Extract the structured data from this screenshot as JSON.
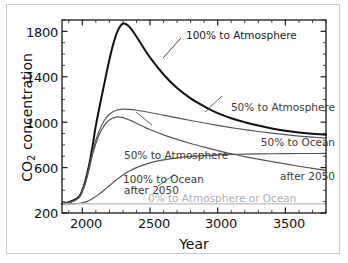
{
  "chart_data": {
    "type": "line",
    "title": "",
    "xlabel": "Year",
    "ylabel": "CO2 concentration",
    "ylabel_rich": "CO₂ concentration",
    "xlim": [
      1850,
      3800
    ],
    "ylim": [
      200,
      1900
    ],
    "xticks": [
      2000,
      2500,
      3000,
      3500
    ],
    "xtick_labels": [
      "2000",
      "2500",
      "3000",
      "3500"
    ],
    "yticks": [
      200,
      600,
      1000,
      1400,
      1800
    ],
    "ytick_labels": [
      "200",
      "600",
      "1000",
      "1400",
      "1800"
    ],
    "x_minor_tick_step": 100,
    "y_minor_tick_step": 100,
    "grid": false,
    "legend": "inline annotations",
    "series": [
      {
        "name": "100% to Atmosphere",
        "color": "#111111",
        "width": 2.0,
        "x": [
          1850,
          1900,
          1950,
          1980,
          2000,
          2020,
          2050,
          2080,
          2100,
          2140,
          2180,
          2220,
          2260,
          2300,
          2340,
          2380,
          2440,
          2500,
          2600,
          2700,
          2800,
          2900,
          3000,
          3100,
          3200,
          3300,
          3400,
          3500,
          3600,
          3700,
          3800
        ],
        "y": [
          280,
          295,
          320,
          350,
          400,
          470,
          620,
          820,
          970,
          1210,
          1440,
          1650,
          1800,
          1868,
          1850,
          1790,
          1680,
          1570,
          1420,
          1300,
          1210,
          1140,
          1080,
          1035,
          1000,
          970,
          945,
          925,
          910,
          898,
          890
        ]
      },
      {
        "name": "50% to Atmosphere 50% to Ocean after 2050",
        "color": "#555555",
        "width": 1.2,
        "x": [
          1850,
          1900,
          1950,
          1980,
          2000,
          2020,
          2050,
          2080,
          2120,
          2160,
          2200,
          2250,
          2300,
          2350,
          2400,
          2500,
          2600,
          2700,
          2800,
          2900,
          3000,
          3100,
          3200,
          3300,
          3400,
          3500,
          3600,
          3700,
          3800
        ],
        "y": [
          280,
          292,
          315,
          345,
          395,
          460,
          600,
          760,
          910,
          1010,
          1070,
          1105,
          1115,
          1112,
          1105,
          1085,
          1062,
          1038,
          1015,
          993,
          972,
          952,
          934,
          918,
          903,
          890,
          878,
          868,
          860
        ]
      },
      {
        "name": "50% to Atmosphere after 2050",
        "color": "#555555",
        "width": 1.2,
        "x": [
          1850,
          1900,
          1950,
          1980,
          2000,
          2020,
          2050,
          2080,
          2120,
          2160,
          2200,
          2250,
          2300,
          2350,
          2400,
          2450,
          2500,
          2600,
          2700,
          2800,
          2900,
          3000,
          3100,
          3200,
          3300,
          3400,
          3500,
          3600,
          3700,
          3800
        ],
        "y": [
          280,
          291,
          313,
          342,
          390,
          452,
          585,
          735,
          878,
          968,
          1020,
          1045,
          1040,
          1018,
          990,
          962,
          935,
          888,
          848,
          812,
          780,
          750,
          722,
          697,
          674,
          652,
          632,
          612,
          593,
          575
        ]
      },
      {
        "name": "100% to Ocean",
        "color": "#555555",
        "width": 1.2,
        "x": [
          1850,
          1900,
          1950,
          1980,
          2000,
          2020,
          2050,
          2080,
          2120,
          2160,
          2200,
          2250,
          2300,
          2350,
          2400,
          2500,
          2600,
          2700,
          2800,
          2900,
          3000,
          3100,
          3200,
          3300,
          3400,
          3500,
          3600,
          3700,
          3800
        ],
        "y": [
          280,
          281,
          283,
          286,
          290,
          296,
          310,
          330,
          362,
          400,
          440,
          490,
          535,
          572,
          600,
          642,
          668,
          686,
          698,
          706,
          712,
          716,
          719,
          721,
          722,
          723,
          724,
          724,
          725
        ]
      },
      {
        "name": "0% to Atmosphere or Ocean",
        "color": "#bdbdbd",
        "width": 1.2,
        "x": [
          1850,
          2000,
          2200,
          2500,
          3000,
          3400,
          3800
        ],
        "y": [
          280,
          280,
          280,
          280,
          280,
          280,
          280
        ]
      }
    ],
    "annotations": [
      {
        "id": "ann-100-atm",
        "text": "100% to Atmosphere",
        "style": "dark"
      },
      {
        "id": "ann-50-50",
        "line1": "50% to Atmosphere",
        "line2": "50% to Ocean",
        "line3": "after 2050",
        "style": "normal"
      },
      {
        "id": "ann-50-atm",
        "line1": "50% to Atmosphere",
        "line2": "after 2050",
        "style": "normal"
      },
      {
        "id": "ann-100-ocean",
        "text": "100% to Ocean",
        "style": "normal"
      },
      {
        "id": "ann-0",
        "text": "0% to Atmosphere or Ocean",
        "style": "faint"
      }
    ]
  },
  "axes": {
    "xlabel": "Year",
    "ylabel_prefix": "CO",
    "ylabel_sub": "2",
    "ylabel_suffix": " concentration"
  },
  "annotations_text": {
    "atm100": "100% to Atmosphere",
    "split_l1": "50% to Atmosphere",
    "split_l2": "50% to Ocean",
    "split_l3": "after 2050",
    "half_l1": "50% to Atmosphere",
    "half_l2": "after 2050",
    "ocean100": "100% to Ocean",
    "zero": "0% to Atmosphere or Ocean"
  },
  "colors": {
    "curve_primary": "#111111",
    "curve_secondary": "#555555",
    "curve_baseline": "#bdbdbd",
    "axis": "#1a1a1a",
    "border": "#c9c9c9"
  }
}
